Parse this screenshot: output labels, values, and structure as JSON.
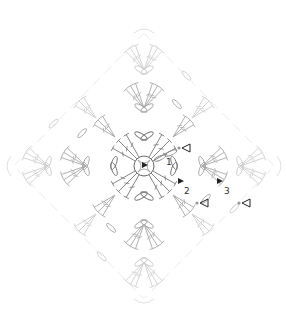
{
  "diagram": {
    "type": "crochet-chart",
    "shape": "granny-diamond",
    "center": [
      144,
      166
    ],
    "rounds": 3,
    "colors": {
      "background": "#ffffff",
      "center_stitches": "#777777",
      "round2_stitches": "#a8a8a8",
      "round3_stitches": "#cfcfcf",
      "outer_stitches": "#dcdcdc",
      "markers": "#222222"
    },
    "labels": [
      {
        "id": "round-1",
        "text": "1",
        "x": 166,
        "y": 165
      },
      {
        "id": "round-2",
        "text": "2",
        "x": 184,
        "y": 194
      },
      {
        "id": "round-3",
        "text": "3",
        "x": 224,
        "y": 194
      }
    ],
    "start_markers": [
      {
        "round": "1",
        "x": 146,
        "y": 165
      },
      {
        "round": "2",
        "x": 182,
        "y": 181
      },
      {
        "round": "3",
        "x": 221,
        "y": 181
      }
    ],
    "end_markers": [
      {
        "round": "1",
        "x": 184,
        "y": 148
      },
      {
        "round": "2",
        "x": 202,
        "y": 203
      },
      {
        "round": "3",
        "x": 244,
        "y": 203
      }
    ]
  }
}
